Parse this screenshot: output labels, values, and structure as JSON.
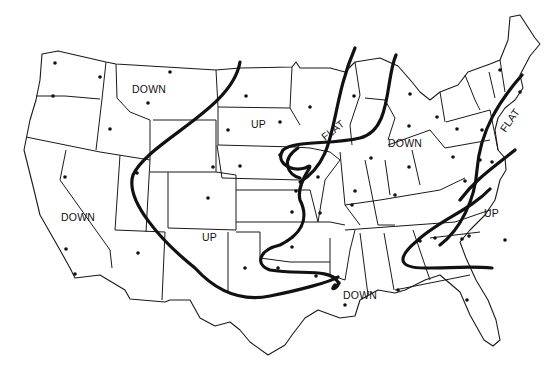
{
  "map": {
    "subject": "Contiguous United States regional trend map",
    "colors": {
      "background": "#ffffff",
      "lines": "#111111"
    },
    "region_labels": [
      {
        "id": "northwest-down",
        "text": "DOWN",
        "x": 132,
        "y": 84
      },
      {
        "id": "northern-plains-up",
        "text": "UP",
        "x": 251,
        "y": 119
      },
      {
        "id": "great-lakes-flat",
        "text": "FLAT",
        "x": 325,
        "y": 128,
        "rotate": -38
      },
      {
        "id": "ohio-valley-down",
        "text": "DOWN",
        "x": 388,
        "y": 138
      },
      {
        "id": "northeast-flat",
        "text": "FLAT",
        "x": 500,
        "y": 118,
        "rotate": -55
      },
      {
        "id": "west-coast-down",
        "text": "DOWN",
        "x": 61,
        "y": 212
      },
      {
        "id": "southwest-up",
        "text": "UP",
        "x": 202,
        "y": 232
      },
      {
        "id": "southeast-up",
        "text": "UP",
        "x": 484,
        "y": 208
      },
      {
        "id": "gulf-down",
        "text": "DOWN",
        "x": 343,
        "y": 290
      }
    ],
    "trend_lines": [
      "M 240 62 C 232 110, 150 140, 133 175 C 125 200, 160 240, 195 268 C 215 290, 240 302, 270 296 C 300 290, 330 282, 338 277",
      "M 300 182 C 340 158, 328 110, 355 48",
      "M 298 148 C 280 160, 288 175, 300 178",
      "M 396 55 C 385 80, 392 130, 360 138 C 330 145, 295 140, 283 150 C 275 162, 290 172, 305 168 C 320 160, 295 180, 300 200 C 310 220, 300 235, 280 245 C 258 250, 255 265, 270 270 C 300 275, 330 268, 338 282 C 340 288, 328 292, 335 285",
      "M 522 75 C 500 100, 480 130, 477 170 C 475 200, 460 230, 440 245",
      "M 515 150 C 490 170, 475 180, 460 200",
      "M 490 189 C 470 210, 440 220, 418 240 C 396 258, 398 268, 425 268 C 450 268, 470 266, 492 268"
    ],
    "cities": [
      [
        55,
        63
      ],
      [
        100,
        77
      ],
      [
        53,
        96
      ],
      [
        170,
        72
      ],
      [
        148,
        103
      ],
      [
        110,
        129
      ],
      [
        65,
        177
      ],
      [
        137,
        173
      ],
      [
        213,
        167
      ],
      [
        246,
        96
      ],
      [
        228,
        130
      ],
      [
        240,
        166
      ],
      [
        208,
        198
      ],
      [
        138,
        253
      ],
      [
        66,
        249
      ],
      [
        75,
        274
      ],
      [
        245,
        268
      ],
      [
        292,
        247
      ],
      [
        320,
        213
      ],
      [
        278,
        268
      ],
      [
        292,
        212
      ],
      [
        296,
        191
      ],
      [
        316,
        276
      ],
      [
        339,
        283
      ],
      [
        355,
        191
      ],
      [
        352,
        205
      ],
      [
        318,
        177
      ],
      [
        280,
        155
      ],
      [
        310,
        107
      ],
      [
        280,
        122
      ],
      [
        354,
        96
      ],
      [
        371,
        158
      ],
      [
        409,
        167
      ],
      [
        395,
        195
      ],
      [
        410,
        94
      ],
      [
        409,
        126
      ],
      [
        437,
        117
      ],
      [
        457,
        129
      ],
      [
        453,
        157
      ],
      [
        482,
        130
      ],
      [
        465,
        181
      ],
      [
        492,
        162
      ],
      [
        462,
        239
      ],
      [
        420,
        241
      ],
      [
        398,
        290
      ],
      [
        345,
        305
      ],
      [
        467,
        300
      ],
      [
        480,
        160
      ],
      [
        520,
        92
      ],
      [
        500,
        70
      ],
      [
        505,
        240
      ],
      [
        469,
        236
      ],
      [
        435,
        238
      ]
    ]
  }
}
